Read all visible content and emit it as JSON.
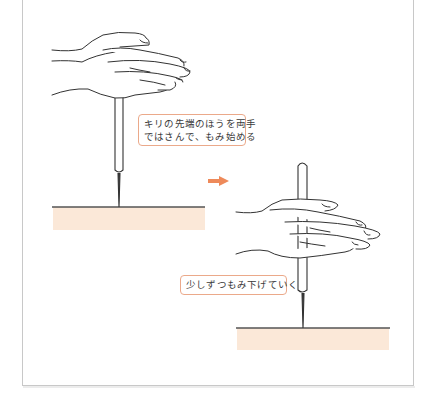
{
  "diagram": {
    "type": "instructional-illustration",
    "steps": [
      {
        "id": "step-1",
        "caption_lines": [
          "キリの先端のほうを両手",
          "ではさんで、もみ始める"
        ]
      },
      {
        "id": "step-2",
        "caption_lines": [
          "少しずつもみ下げていく"
        ]
      }
    ],
    "transition_icon": "right-arrow-icon"
  },
  "colors": {
    "accent_arrow": "#ee8a5a",
    "label_border": "#eba98a",
    "ground_fill": "#fbe8d8",
    "ground_line": "#555555",
    "outline": "#333333",
    "frame_border": "#c8c8c8"
  }
}
